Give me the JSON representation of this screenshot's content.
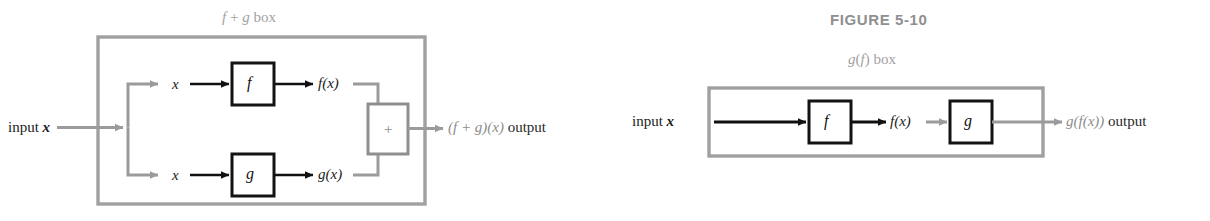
{
  "figure": {
    "title": "FIGURE 5-10",
    "caption_colors": {
      "gray": "#9a9a9a",
      "black": "#1b1b1b"
    }
  },
  "left_diagram": {
    "name": "f + g box diagram",
    "box_label": {
      "f": "f",
      "plus": "+",
      "g": "g",
      "word": "box"
    },
    "input_label": {
      "word": "input",
      "var": "x"
    },
    "branch_top": {
      "input_var": "x",
      "function_box": "f",
      "output_label": "f(x)"
    },
    "branch_bottom": {
      "input_var": "x",
      "function_box": "g",
      "output_label": "g(x)"
    },
    "adder_box": "+",
    "output_label": {
      "expr": "(f + g)(x)",
      "word": "output"
    }
  },
  "right_diagram": {
    "name": "g(f) box diagram",
    "box_label": {
      "g": "g",
      "f": "f",
      "word": "box"
    },
    "input_label": {
      "word": "input",
      "var": "x"
    },
    "first_box": "f",
    "middle_label": "f(x)",
    "second_box": "g",
    "output_label": {
      "expr": "g(f(x))",
      "word": "output"
    }
  }
}
